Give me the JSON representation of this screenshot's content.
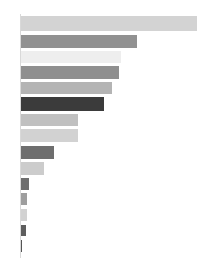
{
  "chart_data": {
    "type": "bar",
    "orientation": "horizontal",
    "title": "",
    "subtitle": "",
    "xlabel": "",
    "ylabel": "",
    "grid": false,
    "legend": null,
    "categories": [
      "1",
      "2",
      "3",
      "4",
      "5",
      "6",
      "7",
      "8",
      "9",
      "10",
      "11",
      "12",
      "13",
      "14",
      "15"
    ],
    "tick_labels": [],
    "xlim": [
      0,
      176
    ],
    "values": [
      176,
      116,
      100,
      98,
      91,
      83,
      57,
      57,
      33,
      23,
      8,
      6,
      6,
      5,
      1
    ],
    "colors": [
      "#d3d3d3",
      "#919191",
      "#eeeeee",
      "#8f8f8f",
      "#b4b4b4",
      "#3b3b3b",
      "#c0c0c0",
      "#d2d2d2",
      "#6e6e6e",
      "#cccccc",
      "#6e6e6e",
      "#9e9e9e",
      "#d2d2d2",
      "#5e5e5e",
      "#555555"
    ],
    "axis_color": "#d9d9d9",
    "background": "#ffffff",
    "bar_geometry": [
      {
        "top": 16,
        "height": 15,
        "left": 21,
        "width": 176
      },
      {
        "top": 35,
        "height": 13,
        "left": 21,
        "width": 116
      },
      {
        "top": 51,
        "height": 12,
        "left": 21,
        "width": 100
      },
      {
        "top": 66,
        "height": 13,
        "left": 21,
        "width": 98
      },
      {
        "top": 82,
        "height": 12,
        "left": 21,
        "width": 91
      },
      {
        "top": 97,
        "height": 14,
        "left": 21,
        "width": 83
      },
      {
        "top": 114,
        "height": 12,
        "left": 21,
        "width": 57
      },
      {
        "top": 129,
        "height": 13,
        "left": 21,
        "width": 57
      },
      {
        "top": 146,
        "height": 13,
        "left": 21,
        "width": 33
      },
      {
        "top": 162,
        "height": 13,
        "left": 21,
        "width": 23
      },
      {
        "top": 178,
        "height": 12,
        "left": 21,
        "width": 8
      },
      {
        "top": 193,
        "height": 12,
        "left": 21,
        "width": 6
      },
      {
        "top": 209,
        "height": 12,
        "left": 21,
        "width": 6
      },
      {
        "top": 225,
        "height": 11,
        "left": 21,
        "width": 5
      },
      {
        "top": 240,
        "height": 12,
        "left": 21,
        "width": 1
      }
    ],
    "axis": {
      "left": 20,
      "top": 14,
      "height": 244
    }
  }
}
